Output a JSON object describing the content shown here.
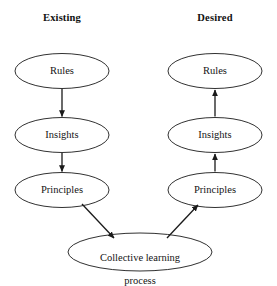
{
  "figure": {
    "background_color": "#ffffff",
    "stroke_color": "#1a1a1a",
    "text_color": "#141414"
  },
  "columns": [
    {
      "id": "existing",
      "heading": "Existing"
    },
    {
      "id": "desired",
      "heading": "Desired"
    }
  ],
  "nodes": {
    "existing_rules": {
      "label": "Rules",
      "cx": 62,
      "cy": 71,
      "rx": 47,
      "ry": 17.5
    },
    "existing_insights": {
      "label": "Insights",
      "cx": 62,
      "cy": 135,
      "rx": 47,
      "ry": 17.5
    },
    "existing_principles": {
      "label": "Principles",
      "cx": 62,
      "cy": 190,
      "rx": 47,
      "ry": 17.5
    },
    "desired_rules": {
      "label": "Rules",
      "cx": 215,
      "cy": 71,
      "rx": 47,
      "ry": 17.5
    },
    "desired_insights": {
      "label": "Insights",
      "cx": 215,
      "cy": 135,
      "rx": 47,
      "ry": 17.5
    },
    "desired_principles": {
      "label": "Principles",
      "cx": 215,
      "cy": 190,
      "rx": 47,
      "ry": 17.5
    },
    "collective": {
      "label": "Collective learning\nprocess",
      "label_line1": "Collective learning",
      "label_line2": "process",
      "cx": 140,
      "cy": 252,
      "rx": 72,
      "ry": 19
    }
  },
  "edges": [
    {
      "id": "existing-rules-to-insights",
      "from": "existing_rules",
      "to": "existing_insights",
      "direction": "down"
    },
    {
      "id": "existing-insights-to-principles",
      "from": "existing_insights",
      "to": "existing_principles",
      "direction": "down"
    },
    {
      "id": "existing-principles-to-collective",
      "from": "existing_principles",
      "to": "collective",
      "direction": "diagonal-down-right"
    },
    {
      "id": "collective-to-desired-principles",
      "from": "collective",
      "to": "desired_principles",
      "direction": "diagonal-up-right"
    },
    {
      "id": "desired-principles-to-insights",
      "from": "desired_principles",
      "to": "desired_insights",
      "direction": "up"
    },
    {
      "id": "desired-insights-to-rules",
      "from": "desired_insights",
      "to": "desired_rules",
      "direction": "up"
    }
  ]
}
